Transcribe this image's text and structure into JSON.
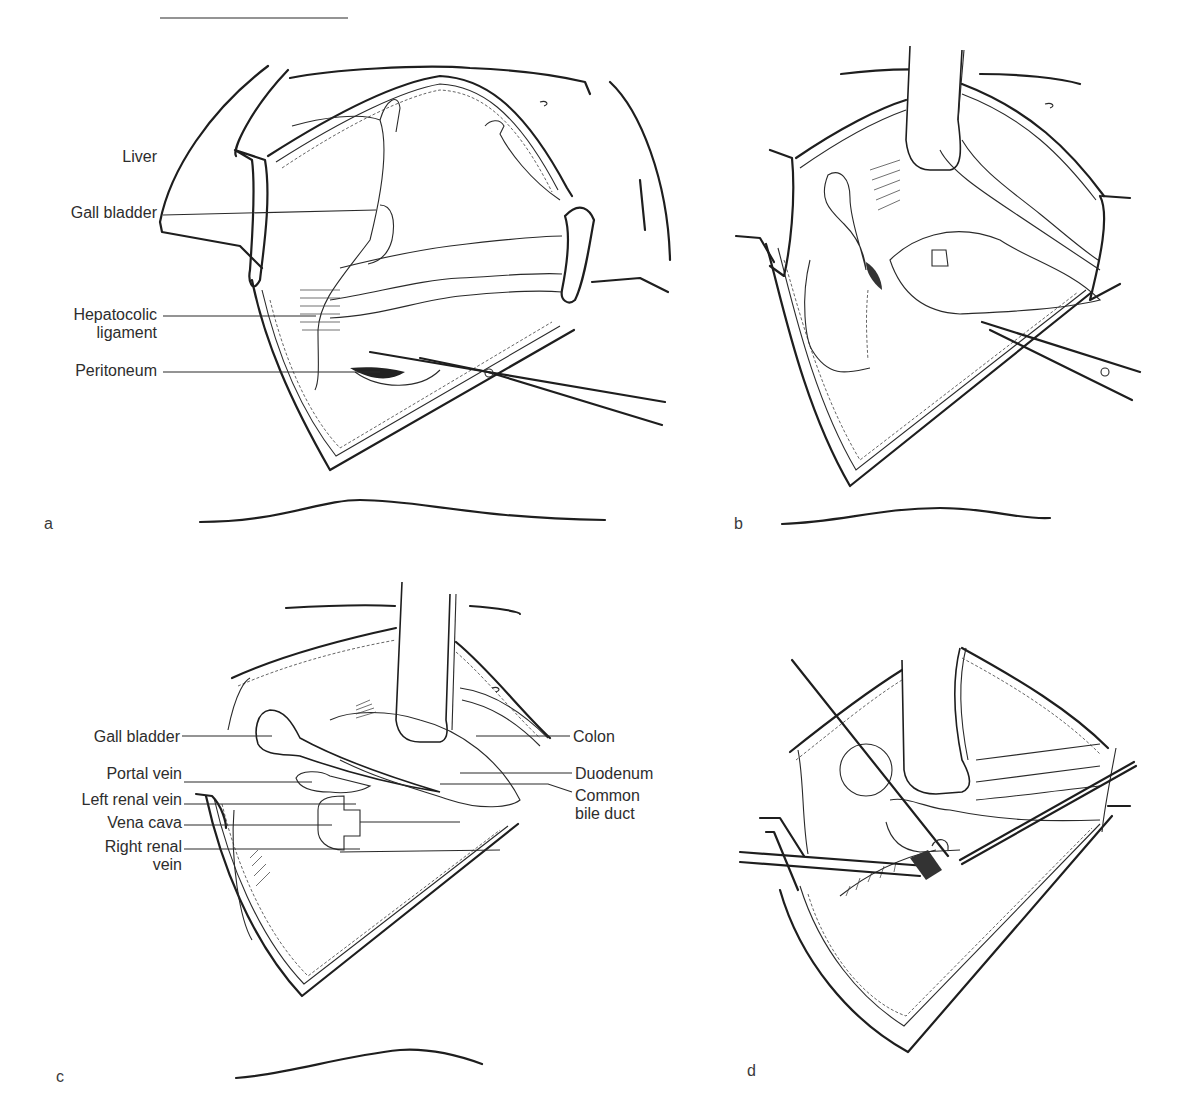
{
  "figure": {
    "panels": [
      {
        "id": "a",
        "letter": "a",
        "labels": [
          {
            "text": "Liver"
          },
          {
            "text": "Gall bladder"
          },
          {
            "text": "Hepatocolic",
            "text2": "ligament"
          },
          {
            "text": "Peritoneum"
          }
        ]
      },
      {
        "id": "b",
        "letter": "b",
        "labels": []
      },
      {
        "id": "c",
        "letter": "c",
        "labels_left": [
          {
            "text": "Gall bladder"
          },
          {
            "text": "Portal vein"
          },
          {
            "text": "Left renal vein"
          },
          {
            "text": "Vena cava"
          },
          {
            "text": "Right renal",
            "text2": "vein"
          }
        ],
        "labels_right": [
          {
            "text": "Colon"
          },
          {
            "text": "Duodenum"
          },
          {
            "text": "Common",
            "text2": "bile duct"
          }
        ]
      },
      {
        "id": "d",
        "letter": "d",
        "labels": []
      }
    ]
  }
}
